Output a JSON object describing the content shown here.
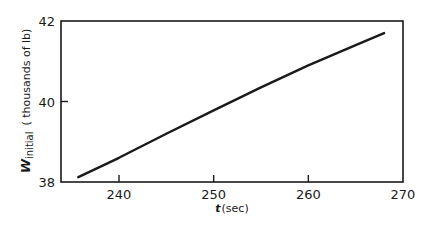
{
  "chart_data": {
    "type": "line",
    "title": "",
    "xlabel": "t (sec)",
    "ylabel": "W_initial (thousands of lb)",
    "ylabel_parts": {
      "symbol": "W",
      "subscript": "initial",
      "units": "( thousands of lb)"
    },
    "xlabel_parts": {
      "symbol": "t",
      "units": "(sec)"
    },
    "xlim": [
      230,
      270
    ],
    "ylim": [
      38,
      42
    ],
    "x_ticks": [
      240,
      250,
      260,
      270
    ],
    "y_ticks": [
      38,
      40,
      42
    ],
    "x_tick_labels": [
      "240",
      "250",
      "260",
      "270"
    ],
    "y_tick_labels": [
      "38",
      "40",
      "42"
    ],
    "grid": false,
    "legend": null,
    "series": [
      {
        "name": "W_initial",
        "x": [
          235.7,
          240,
          245,
          250,
          255,
          260,
          265,
          268
        ],
        "y": [
          38.12,
          38.6,
          39.2,
          39.78,
          40.35,
          40.9,
          41.4,
          41.7
        ]
      }
    ]
  },
  "colors": {
    "line": "#1a1a1a",
    "axis": "#1a1a1a",
    "background": "#ffffff"
  }
}
